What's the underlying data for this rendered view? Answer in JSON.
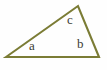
{
  "figure": {
    "name": "scalene-triangle-diagram",
    "background_color": "#fefefe",
    "width": 107,
    "height": 70,
    "stroke_color": "#7b7c35",
    "stroke_width": 2.1,
    "label_color": "#3a3a32"
  },
  "shape": {
    "type": "triangle",
    "vertices": [
      {
        "name": "left-vertex",
        "x": 6,
        "y": 57
      },
      {
        "name": "apex-vertex",
        "x": 78,
        "y": 6
      },
      {
        "name": "right-vertex",
        "x": 99,
        "y": 57
      }
    ],
    "polygon_points": "6,57 78,6 99,57",
    "sides": [
      {
        "name": "base-side",
        "from": "left-vertex",
        "to": "right-vertex"
      },
      {
        "name": "left-side",
        "from": "left-vertex",
        "to": "apex-vertex"
      },
      {
        "name": "right-side",
        "from": "apex-vertex",
        "to": "right-vertex"
      }
    ]
  },
  "labels": {
    "a": "a",
    "b": "b",
    "c": "c"
  },
  "chart_data": {
    "type": "diagram",
    "title": "",
    "shape": "scalene triangle",
    "annotations": [
      {
        "text": "a",
        "x": 33,
        "y": 46,
        "describes": "interior angle at left vertex"
      },
      {
        "text": "b",
        "x": 81,
        "y": 44,
        "describes": "interior angle at right vertex"
      },
      {
        "text": "c",
        "x": 71,
        "y": 20,
        "describes": "interior angle at apex vertex"
      }
    ]
  }
}
